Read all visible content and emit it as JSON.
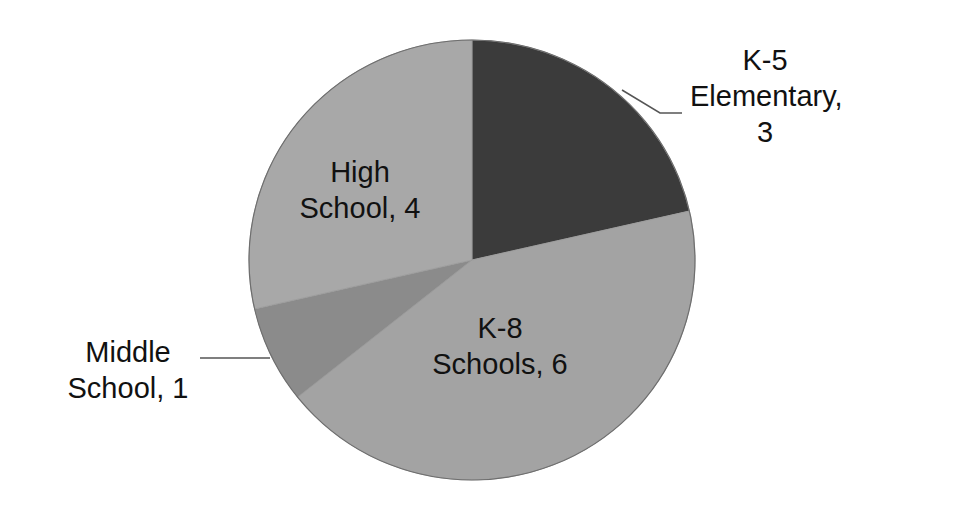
{
  "chart_data": {
    "type": "pie",
    "title": "",
    "categories": [
      "K-5 Elementary",
      "K-8 Schools",
      "Middle School",
      "High School"
    ],
    "values": [
      3,
      6,
      1,
      4
    ],
    "colors": [
      "#3b3b3b",
      "#a3a3a3",
      "#8b8b8b",
      "#a8a8a8"
    ],
    "start_angle_deg": 0,
    "direction": "clockwise",
    "legend": "none",
    "data_labels": [
      {
        "line1": "K-5",
        "line2": "Elementary,",
        "line3": "3"
      },
      {
        "line1": "K-8",
        "line2": "Schools, 6"
      },
      {
        "line1": "Middle",
        "line2": "School, 1"
      },
      {
        "line1": "High",
        "line2": "School, 4"
      }
    ]
  }
}
